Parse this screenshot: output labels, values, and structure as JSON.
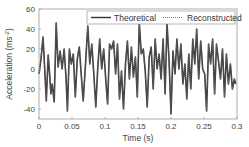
{
  "chart_data": {
    "type": "line",
    "title": "",
    "xlabel": "Time (s)",
    "ylabel": "Acceleration (m/s²)",
    "ylabel_base": "Acceleration (ms",
    "ylabel_sup": "-2",
    "xlim": [
      0,
      0.3
    ],
    "ylim": [
      -50,
      60
    ],
    "xticks": [
      0,
      0.05,
      0.1,
      0.15,
      0.2,
      0.25,
      0.3
    ],
    "xtick_labels": [
      "0",
      "0.05",
      "0.1",
      "0.15",
      "0.2",
      "0.25",
      "0.3"
    ],
    "yticks": [
      60,
      40,
      20,
      0,
      -20,
      -40
    ],
    "ytick_labels": [
      "60",
      "40",
      "20",
      "0",
      "-20",
      "-40"
    ],
    "grid": false,
    "legend_position": "upper right",
    "legend": [
      "Theoretical",
      "Reconstructed"
    ],
    "series": [
      {
        "name": "Theoretical",
        "style": "solid",
        "color": "#333333",
        "x": [
          0.0,
          0.003,
          0.006,
          0.008,
          0.011,
          0.014,
          0.016,
          0.018,
          0.02,
          0.023,
          0.026,
          0.029,
          0.032,
          0.035,
          0.038,
          0.041,
          0.043,
          0.046,
          0.049,
          0.052,
          0.055,
          0.058,
          0.061,
          0.064,
          0.067,
          0.07,
          0.074,
          0.077,
          0.08,
          0.083,
          0.086,
          0.089,
          0.092,
          0.095,
          0.098,
          0.101,
          0.104,
          0.107,
          0.11,
          0.113,
          0.116,
          0.119,
          0.122,
          0.125,
          0.128,
          0.131,
          0.134,
          0.137,
          0.14,
          0.143,
          0.146,
          0.149,
          0.152,
          0.155,
          0.158,
          0.161,
          0.164,
          0.167,
          0.17,
          0.173,
          0.176,
          0.179,
          0.182,
          0.185,
          0.188,
          0.191,
          0.194,
          0.197,
          0.2,
          0.203,
          0.206,
          0.209,
          0.212,
          0.215,
          0.218,
          0.221,
          0.224,
          0.227,
          0.23,
          0.233,
          0.236,
          0.239,
          0.242,
          0.245,
          0.248,
          0.251,
          0.254,
          0.257,
          0.26,
          0.263,
          0.266,
          0.269,
          0.272,
          0.275,
          0.278,
          0.281,
          0.284,
          0.287,
          0.29,
          0.293,
          0.296,
          0.298
        ],
        "y": [
          -5,
          10,
          32,
          8,
          -32,
          14,
          -5,
          -25,
          -15,
          -33,
          46,
          2,
          18,
          0,
          20,
          -10,
          -42,
          20,
          5,
          15,
          -28,
          10,
          22,
          -5,
          -32,
          0,
          43,
          5,
          25,
          -5,
          -38,
          0,
          30,
          0,
          20,
          -10,
          -35,
          25,
          20,
          28,
          -5,
          25,
          -30,
          -2,
          -40,
          5,
          28,
          -10,
          22,
          -8,
          12,
          -28,
          46,
          15,
          20,
          -3,
          -38,
          12,
          22,
          -20,
          30,
          0,
          15,
          -10,
          30,
          -25,
          46,
          10,
          -45,
          18,
          -5,
          30,
          0,
          25,
          -15,
          5,
          -30,
          15,
          -20,
          30,
          5,
          40,
          -10,
          28,
          0,
          -5,
          -42,
          25,
          5,
          30,
          -25,
          25,
          8,
          -10,
          20,
          -28,
          15,
          -15,
          5,
          -20,
          -10,
          -15
        ]
      },
      {
        "name": "Reconstructed",
        "style": "dotted",
        "color": "#777777",
        "same_as": "Theoretical"
      }
    ]
  }
}
